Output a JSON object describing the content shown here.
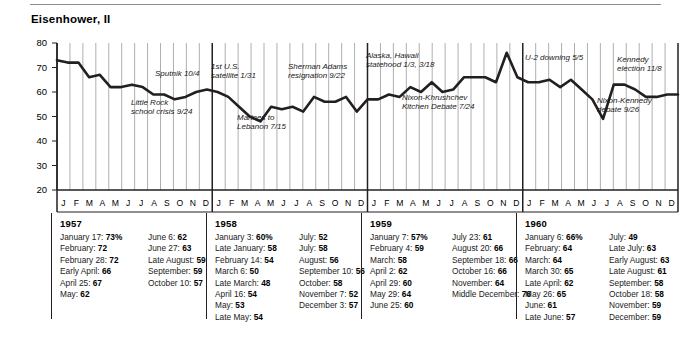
{
  "page_title": "Eisenhower, II",
  "chart_data": {
    "type": "line",
    "title": "Eisenhower, II",
    "xlabel": "",
    "ylabel": "",
    "ylim": [
      20,
      80
    ],
    "yticks": [
      20,
      30,
      40,
      50,
      60,
      70,
      80
    ],
    "grid": true,
    "legend": "none",
    "months": [
      "J",
      "F",
      "M",
      "A",
      "M",
      "J",
      "J",
      "A",
      "S",
      "O",
      "N",
      "D"
    ],
    "years": [
      "1957",
      "1958",
      "1959",
      "1960"
    ],
    "series": [
      {
        "name": "Presidential approval",
        "values": [
          73,
          72,
          72,
          66,
          67,
          62,
          62,
          63,
          62,
          59,
          59,
          57,
          58,
          60,
          61,
          60,
          58,
          54,
          50,
          48,
          54,
          53,
          54,
          52,
          58,
          56,
          56,
          58,
          52,
          57,
          57,
          59,
          58,
          62,
          60,
          64,
          60,
          61,
          66,
          66,
          66,
          64,
          76,
          66,
          64,
          64,
          65,
          62,
          65,
          61,
          57,
          49,
          63,
          63,
          61,
          58,
          58,
          59,
          59
        ]
      }
    ],
    "annotations": [
      {
        "text": "Little Rock\nschool crisis 9/24"
      },
      {
        "text": "Sputnik 10/4"
      },
      {
        "text": "1st U.S.\nsatellite 1/31"
      },
      {
        "text": "Marines to\nLebanon 7/15"
      },
      {
        "text": "Sherman Adams\nresignation 9/22"
      },
      {
        "text": "Alaska, Hawaii\nstatehood 1/3, 3/18"
      },
      {
        "text": "Nixon-Khrushchev\nKitchen Debate 7/24"
      },
      {
        "text": "U-2 downing 5/5"
      },
      {
        "text": "Nixon-Kennedy\ndebate 9/26"
      },
      {
        "text": "Kennedy\nelection 11/8"
      }
    ]
  },
  "annotations": {
    "little_rock_l1": "Little Rock",
    "little_rock_l2": "school crisis 9/24",
    "sputnik": "Sputnik 10/4",
    "satellite_l1": "1st U.S.",
    "satellite_l2": "satellite 1/31",
    "lebanon_l1": "Marines to",
    "lebanon_l2": "Lebanon 7/15",
    "adams_l1": "Sherman Adams",
    "adams_l2": "resignation 9/22",
    "statehood_l1": "Alaska, Hawaii",
    "statehood_l2": "statehood 1/3, 3/18",
    "kitchen_l1": "Nixon-Khrushchev",
    "kitchen_l2": "Kitchen Debate 7/24",
    "u2": "U-2 downing 5/5",
    "debate_l1": "Nixon-Kennedy",
    "debate_l2": "debate 9/26",
    "election_l1": "Kennedy",
    "election_l2": "election 11/8"
  },
  "tables": [
    {
      "year": "1957",
      "columns": [
        [
          {
            "label": "January 17:",
            "value": "73%"
          },
          {
            "label": "February:",
            "value": "72"
          },
          {
            "label": "February 28:",
            "value": "72"
          },
          {
            "label": "Early April:",
            "value": "66"
          },
          {
            "label": "April 25:",
            "value": "67"
          },
          {
            "label": "May:",
            "value": "62"
          }
        ],
        [
          {
            "label": "June 6:",
            "value": "62"
          },
          {
            "label": "June 27:",
            "value": "63"
          },
          {
            "label": "Late August:",
            "value": "59"
          },
          {
            "label": "September:",
            "value": "59"
          },
          {
            "label": "October 10:",
            "value": "57"
          }
        ]
      ]
    },
    {
      "year": "1958",
      "columns": [
        [
          {
            "label": "January 3:",
            "value": "60%"
          },
          {
            "label": "Late January:",
            "value": "58"
          },
          {
            "label": "February 14:",
            "value": "54"
          },
          {
            "label": "March 6:",
            "value": "50"
          },
          {
            "label": "Late March:",
            "value": "48"
          },
          {
            "label": "April 16:",
            "value": "54"
          },
          {
            "label": "May:",
            "value": "53"
          },
          {
            "label": "Late May:",
            "value": "54"
          }
        ],
        [
          {
            "label": "July:",
            "value": "52"
          },
          {
            "label": "July:",
            "value": "58"
          },
          {
            "label": "August:",
            "value": "56"
          },
          {
            "label": "September 10:",
            "value": "56"
          },
          {
            "label": "October:",
            "value": "58"
          },
          {
            "label": "November 7:",
            "value": "52"
          },
          {
            "label": "December 3:",
            "value": "57"
          }
        ]
      ]
    },
    {
      "year": "1959",
      "columns": [
        [
          {
            "label": "January 7:",
            "value": "57%"
          },
          {
            "label": "February 4:",
            "value": "59"
          },
          {
            "label": "March:",
            "value": "58"
          },
          {
            "label": "April 2:",
            "value": "62"
          },
          {
            "label": "April 29:",
            "value": "60"
          },
          {
            "label": "May 29:",
            "value": "64"
          },
          {
            "label": "June 25:",
            "value": "60"
          }
        ],
        [
          {
            "label": "July 23:",
            "value": "61"
          },
          {
            "label": "August 20:",
            "value": "66"
          },
          {
            "label": "September 18:",
            "value": "66"
          },
          {
            "label": "October 16:",
            "value": "66"
          },
          {
            "label": "November:",
            "value": "64"
          },
          {
            "label": "Middle December:",
            "value": "76"
          }
        ]
      ]
    },
    {
      "year": "1960",
      "columns": [
        [
          {
            "label": "January 6:",
            "value": "66%"
          },
          {
            "label": "February:",
            "value": "64"
          },
          {
            "label": "March:",
            "value": "64"
          },
          {
            "label": "March 30:",
            "value": "65"
          },
          {
            "label": "Late April:",
            "value": "62"
          },
          {
            "label": "May 26:",
            "value": "65"
          },
          {
            "label": "June:",
            "value": "61"
          },
          {
            "label": "Late June:",
            "value": "57"
          }
        ],
        [
          {
            "label": "July:",
            "value": "49"
          },
          {
            "label": "Late July:",
            "value": "63"
          },
          {
            "label": "Early August:",
            "value": "63"
          },
          {
            "label": "Late August:",
            "value": "61"
          },
          {
            "label": "September:",
            "value": "58"
          },
          {
            "label": "October 18:",
            "value": "58"
          },
          {
            "label": "November:",
            "value": "59"
          },
          {
            "label": "December:",
            "value": "59"
          }
        ]
      ]
    }
  ]
}
